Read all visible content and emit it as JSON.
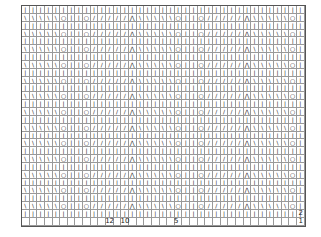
{
  "grid": {
    "cols": 37,
    "rows": 28,
    "cell_w": 7.65,
    "cell_h": 7.85
  },
  "symbols": {
    "k": "|",
    "ssk": "\\",
    "k2tog": "/",
    "yo": "○",
    "cdd": "⋀",
    "empty": ""
  },
  "pattern_row": [
    "ssk",
    "ssk",
    "ssk",
    "ssk",
    "ssk",
    "yo",
    "k",
    "k",
    "yo",
    "k2tog",
    "k2tog",
    "k2tog",
    "k2tog",
    "k2tog",
    "cdd",
    "ssk",
    "ssk",
    "ssk",
    "ssk",
    "ssk",
    "yo",
    "k",
    "k",
    "yo",
    "k2tog",
    "k2tog",
    "k2tog",
    "k2tog",
    "k2tog",
    "cdd",
    "ssk",
    "ssk",
    "ssk",
    "ssk",
    "ssk",
    "yo",
    "k"
  ],
  "plain_row": "k",
  "row_labels": [
    {
      "text": "2",
      "row": 26
    },
    {
      "text": "1",
      "row": 27
    }
  ],
  "col_labels": [
    {
      "text": "12",
      "col": 11
    },
    {
      "text": "10",
      "col": 13
    },
    {
      "text": "5",
      "col": 20
    }
  ]
}
